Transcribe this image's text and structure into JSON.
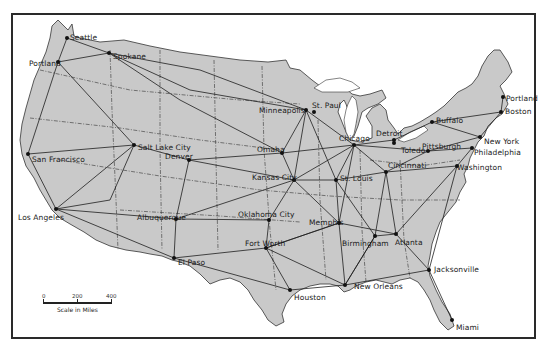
{
  "map": {
    "title": "United States Railroad Network",
    "land_color": "#c9c9c9",
    "water_color": "#ffffff",
    "line_color": "#1e1e1e",
    "frame_color": "#2a2a2a"
  },
  "cities": [
    {
      "name": "Seattle",
      "dot": [
        67,
        38
      ],
      "label": [
        70,
        34
      ]
    },
    {
      "name": "Spokane",
      "dot": [
        109,
        53
      ],
      "label": [
        113,
        53
      ]
    },
    {
      "name": "Portland",
      "dot": [
        58,
        62
      ],
      "label": [
        29,
        60
      ]
    },
    {
      "name": "Minneapolis",
      "dot": [
        306,
        110
      ],
      "label": [
        259,
        107
      ]
    },
    {
      "name": "St. Paul",
      "dot": [
        314,
        112
      ],
      "label": [
        312,
        102
      ]
    },
    {
      "name": "Portland",
      "dot": [
        503,
        97
      ],
      "label": [
        506,
        95
      ]
    },
    {
      "name": "Boston",
      "dot": [
        501,
        112
      ],
      "label": [
        505,
        108
      ]
    },
    {
      "name": "Detroit",
      "dot": [
        394,
        140
      ],
      "label": [
        376,
        130
      ]
    },
    {
      "name": "Toledo",
      "dot": [
        394,
        143
      ],
      "label": [
        401,
        147
      ]
    },
    {
      "name": "Buffalo",
      "dot": [
        432,
        122
      ],
      "label": [
        436,
        117
      ]
    },
    {
      "name": "New York",
      "dot": [
        480,
        137
      ],
      "label": [
        484,
        138
      ]
    },
    {
      "name": "Philadelphia",
      "dot": [
        472,
        148
      ],
      "label": [
        474,
        149
      ]
    },
    {
      "name": "Pittsburgh",
      "dot": [
        428,
        151
      ],
      "label": [
        422,
        143
      ]
    },
    {
      "name": "Washington",
      "dot": [
        457,
        166
      ],
      "label": [
        457,
        164
      ]
    },
    {
      "name": "Chicago",
      "dot": [
        354,
        145
      ],
      "label": [
        339,
        135
      ]
    },
    {
      "name": "Cincinnati",
      "dot": [
        386,
        172
      ],
      "label": [
        388,
        162
      ]
    },
    {
      "name": "Omaha",
      "dot": [
        282,
        153
      ],
      "label": [
        257,
        146
      ]
    },
    {
      "name": "Kansas City",
      "dot": [
        294,
        180
      ],
      "label": [
        252,
        174
      ]
    },
    {
      "name": "St. Louis",
      "dot": [
        336,
        180
      ],
      "label": [
        340,
        175
      ]
    },
    {
      "name": "Salt Lake City",
      "dot": [
        134,
        145
      ],
      "label": [
        138,
        144
      ]
    },
    {
      "name": "Denver",
      "dot": [
        189,
        160
      ],
      "label": [
        165,
        153
      ]
    },
    {
      "name": "San Francisco",
      "dot": [
        28,
        154
      ],
      "label": [
        32,
        156
      ]
    },
    {
      "name": "Los Angeles",
      "dot": [
        56,
        209
      ],
      "label": [
        18,
        214
      ]
    },
    {
      "name": "Albuquerque",
      "dot": [
        176,
        219
      ],
      "label": [
        137,
        214
      ]
    },
    {
      "name": "Oklahoma City",
      "dot": [
        269,
        220
      ],
      "label": [
        238,
        211
      ]
    },
    {
      "name": "Memphis",
      "dot": [
        339,
        223
      ],
      "label": [
        309,
        219
      ]
    },
    {
      "name": "Birmingham",
      "dot": [
        375,
        236
      ],
      "label": [
        342,
        240
      ]
    },
    {
      "name": "Atlanta",
      "dot": [
        396,
        234
      ],
      "label": [
        395,
        239
      ]
    },
    {
      "name": "Fort Worth",
      "dot": [
        266,
        248
      ],
      "label": [
        245,
        240
      ]
    },
    {
      "name": "El Paso",
      "dot": [
        174,
        258
      ],
      "label": [
        178,
        259
      ]
    },
    {
      "name": "Houston",
      "dot": [
        290,
        290
      ],
      "label": [
        294,
        294
      ]
    },
    {
      "name": "New Orleans",
      "dot": [
        345,
        285
      ],
      "label": [
        354,
        283
      ]
    },
    {
      "name": "Jacksonville",
      "dot": [
        429,
        270
      ],
      "label": [
        434,
        266
      ]
    },
    {
      "name": "Miami",
      "dot": [
        452,
        320
      ],
      "label": [
        456,
        324
      ]
    }
  ],
  "scale": {
    "ticks": [
      "0",
      "200",
      "400"
    ],
    "label": "Scale in Miles"
  }
}
